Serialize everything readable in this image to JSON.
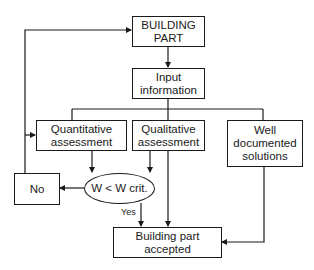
{
  "diagram": {
    "nodes": {
      "building_part": "BUILDING\nPART",
      "input_information": "Input\ninformation",
      "quantitative": "Quantitative\nassessment",
      "qualitative": "Qualitative\nassessment",
      "well_documented": "Well\ndocumented\nsolutions",
      "decision": "W < W crit.",
      "no": "No",
      "accepted": "Building part accepted"
    },
    "edge_labels": {
      "yes": "Yes"
    },
    "edges": [
      {
        "from": "building_part",
        "to": "input_information"
      },
      {
        "from": "input_information",
        "to": "quantitative"
      },
      {
        "from": "input_information",
        "to": "qualitative"
      },
      {
        "from": "input_information",
        "to": "well_documented"
      },
      {
        "from": "quantitative",
        "to": "decision"
      },
      {
        "from": "qualitative",
        "to": "decision"
      },
      {
        "from": "qualitative",
        "to": "accepted"
      },
      {
        "from": "decision",
        "to": "no"
      },
      {
        "from": "decision",
        "to": "accepted",
        "label": "Yes"
      },
      {
        "from": "no",
        "to": "building_part"
      },
      {
        "from": "no",
        "to": "quantitative"
      },
      {
        "from": "well_documented",
        "to": "accepted"
      }
    ]
  }
}
